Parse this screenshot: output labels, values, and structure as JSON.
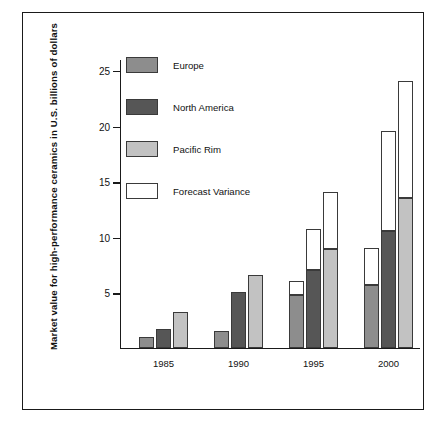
{
  "chart_data": {
    "type": "bar",
    "title": "",
    "xlabel": "",
    "ylabel": "Market value for high-performance ceramics in U.S. billions of dollars",
    "categories": [
      "1985",
      "1990",
      "1995",
      "2000"
    ],
    "ylim": [
      0,
      26
    ],
    "yticks": [
      5,
      10,
      15,
      20,
      25
    ],
    "ytick_labels": [
      "5",
      "10",
      "15",
      "20",
      "25"
    ],
    "grid": false,
    "legend_position": "upper-left-inside",
    "stacked": true,
    "stack_note": "Each regional bar is topped by a white Forecast Variance segment showing the upper forecast bound",
    "series": [
      {
        "name": "Europe",
        "color": "#8d8d8d",
        "values": [
          1.0,
          1.5,
          4.7,
          5.6
        ],
        "forecast_upper": [
          1.0,
          1.5,
          6.0,
          9.0
        ]
      },
      {
        "name": "North America",
        "color": "#565656",
        "values": [
          1.7,
          5.0,
          7.0,
          10.5
        ],
        "forecast_upper": [
          1.7,
          5.0,
          10.7,
          19.5
        ]
      },
      {
        "name": "Pacific Rim",
        "color": "#c2c2c2",
        "values": [
          3.2,
          6.5,
          8.9,
          13.5
        ],
        "forecast_upper": [
          3.2,
          6.5,
          14.0,
          24.0
        ]
      }
    ],
    "legend": [
      {
        "label": "Europe",
        "color": "#8d8d8d"
      },
      {
        "label": "North America",
        "color": "#565656"
      },
      {
        "label": "Pacific Rim",
        "color": "#c2c2c2"
      },
      {
        "label": "Forecast Variance",
        "color": "#ffffff"
      }
    ]
  }
}
